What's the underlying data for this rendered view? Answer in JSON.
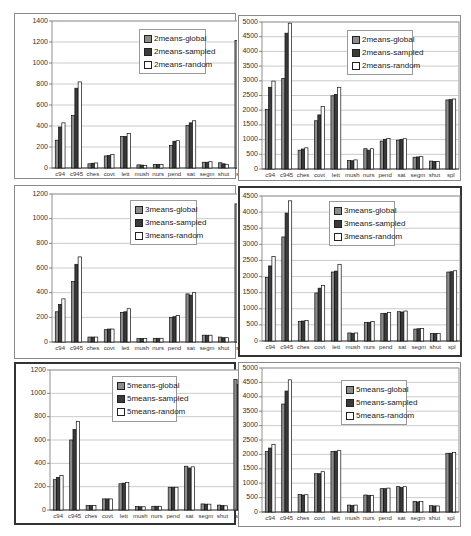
{
  "colors": {
    "global": "#8c8c8c",
    "sampled": "#3a3a3a",
    "random": "#ffffff",
    "bar_stroke": "#111111",
    "grid": "#b5b5b5"
  },
  "chart_data": [
    {
      "type": "bar",
      "title": "",
      "xlabel": "",
      "ylabel": "",
      "ylim": [
        0,
        1400
      ],
      "yticks": [
        0,
        200,
        400,
        600,
        800,
        1000,
        1200,
        1400
      ],
      "grid": true,
      "legend_position": "upper-center-right",
      "categories": [
        "c94",
        "c945",
        "ches",
        "covt",
        "lett",
        "mush",
        "nurs",
        "pend",
        "sat",
        "segm",
        "shut",
        "spl"
      ],
      "series": [
        {
          "name": "2means-global",
          "values": [
            265,
            500,
            40,
            115,
            300,
            30,
            35,
            215,
            405,
            55,
            50,
            1215
          ]
        },
        {
          "name": "2means-sampled",
          "values": [
            390,
            760,
            45,
            120,
            300,
            28,
            35,
            255,
            430,
            55,
            40,
            1225
          ]
        },
        {
          "name": "2means-random",
          "values": [
            430,
            820,
            48,
            130,
            330,
            25,
            35,
            260,
            450,
            60,
            35,
            1260
          ]
        }
      ]
    },
    {
      "type": "bar",
      "title": "",
      "xlabel": "",
      "ylabel": "",
      "ylim": [
        0,
        5000
      ],
      "yticks": [
        0,
        500,
        1000,
        1500,
        2000,
        2500,
        3000,
        3500,
        4000,
        4500,
        5000
      ],
      "grid": true,
      "legend_position": "upper-right",
      "categories": [
        "c94",
        "c945",
        "ches",
        "covt",
        "lett",
        "mush",
        "nurs",
        "pend",
        "sat",
        "segm",
        "shut",
        "spl"
      ],
      "series": [
        {
          "name": "2means-global",
          "values": [
            2030,
            3080,
            640,
            1640,
            2490,
            290,
            690,
            950,
            980,
            400,
            270,
            2350
          ]
        },
        {
          "name": "2means-sampled",
          "values": [
            2780,
            4620,
            680,
            1840,
            2540,
            280,
            640,
            1010,
            1010,
            410,
            260,
            2360
          ]
        },
        {
          "name": "2means-random",
          "values": [
            2990,
            4960,
            720,
            2130,
            2780,
            310,
            690,
            1040,
            1030,
            420,
            260,
            2380
          ]
        }
      ]
    },
    {
      "type": "bar",
      "title": "",
      "xlabel": "",
      "ylabel": "",
      "ylim": [
        0,
        1200
      ],
      "yticks": [
        0,
        200,
        400,
        600,
        800,
        1000,
        1200
      ],
      "grid": true,
      "legend_position": "upper-center-right",
      "categories": [
        "c94",
        "c945",
        "ches",
        "covt",
        "lett",
        "mush",
        "nurs",
        "pend",
        "sat",
        "segm",
        "shut",
        "spl"
      ],
      "series": [
        {
          "name": "3means-global",
          "values": [
            245,
            490,
            40,
            100,
            240,
            28,
            30,
            200,
            390,
            55,
            40,
            1120
          ]
        },
        {
          "name": "3means-sampled",
          "values": [
            305,
            630,
            40,
            105,
            245,
            28,
            30,
            205,
            380,
            55,
            35,
            1115
          ]
        },
        {
          "name": "3means-random",
          "values": [
            350,
            690,
            40,
            105,
            270,
            28,
            30,
            215,
            400,
            55,
            35,
            1165
          ]
        }
      ]
    },
    {
      "type": "bar",
      "title": "",
      "xlabel": "",
      "ylabel": "",
      "ylim": [
        0,
        4500
      ],
      "yticks": [
        0,
        500,
        1000,
        1500,
        2000,
        2500,
        3000,
        3500,
        4000,
        4500
      ],
      "grid": true,
      "legend_position": "upper-center",
      "categories": [
        "c94",
        "c945",
        "ches",
        "covt",
        "lett",
        "mush",
        "nurs",
        "pend",
        "sat",
        "segm",
        "shut",
        "spl"
      ],
      "series": [
        {
          "name": "3means-global",
          "values": [
            1970,
            3230,
            610,
            1490,
            2140,
            250,
            570,
            850,
            910,
            370,
            230,
            2140
          ]
        },
        {
          "name": "3means-sampled",
          "values": [
            2330,
            3970,
            620,
            1640,
            2170,
            240,
            580,
            860,
            900,
            380,
            230,
            2150
          ]
        },
        {
          "name": "3means-random",
          "values": [
            2620,
            4350,
            640,
            1720,
            2380,
            250,
            610,
            890,
            930,
            390,
            230,
            2180
          ]
        }
      ]
    },
    {
      "type": "bar",
      "title": "",
      "xlabel": "",
      "ylabel": "",
      "ylim": [
        0,
        1200
      ],
      "yticks": [
        0,
        200,
        400,
        600,
        800,
        1000,
        1200
      ],
      "grid": true,
      "legend_position": "upper-center-right",
      "categories": [
        "c94",
        "c945",
        "ches",
        "covt",
        "lett",
        "mush",
        "nurs",
        "pend",
        "sat",
        "segm",
        "shut",
        "spl"
      ],
      "series": [
        {
          "name": "5means-global",
          "values": [
            260,
            600,
            38,
            95,
            225,
            30,
            32,
            195,
            375,
            52,
            42,
            1120
          ]
        },
        {
          "name": "5means-sampled",
          "values": [
            280,
            690,
            38,
            95,
            230,
            28,
            32,
            195,
            360,
            50,
            38,
            1075
          ]
        },
        {
          "name": "5means-random",
          "values": [
            295,
            760,
            38,
            95,
            235,
            28,
            32,
            195,
            370,
            50,
            36,
            1120
          ]
        }
      ]
    },
    {
      "type": "bar",
      "title": "",
      "xlabel": "",
      "ylabel": "",
      "ylim": [
        0,
        5000
      ],
      "yticks": [
        0,
        500,
        1000,
        1500,
        2000,
        2500,
        3000,
        3500,
        4000,
        4500,
        5000
      ],
      "grid": true,
      "legend_position": "upper-center-right",
      "categories": [
        "c94",
        "c945",
        "ches",
        "covt",
        "lett",
        "mush",
        "nurs",
        "pend",
        "sat",
        "segm",
        "shut",
        "spl"
      ],
      "series": [
        {
          "name": "5means-global",
          "values": [
            2100,
            3750,
            610,
            1330,
            2100,
            240,
            590,
            810,
            880,
            370,
            220,
            2040
          ]
        },
        {
          "name": "5means-sampled",
          "values": [
            2220,
            4200,
            590,
            1330,
            2110,
            230,
            580,
            810,
            850,
            350,
            210,
            2040
          ]
        },
        {
          "name": "5means-random",
          "values": [
            2350,
            4590,
            600,
            1400,
            2130,
            240,
            570,
            830,
            880,
            360,
            210,
            2070
          ]
        }
      ]
    }
  ],
  "panels": [
    {
      "left": 14,
      "top": 13,
      "width": 222,
      "height": 166,
      "border": "thin",
      "plot": {
        "x": 37,
        "y": 7,
        "w": 196,
        "h": 147
      },
      "legend": {
        "x": 124,
        "y": 15,
        "w": 67,
        "h": 45
      }
    },
    {
      "left": 238,
      "top": 15,
      "width": 223,
      "height": 166,
      "border": "thin",
      "plot": {
        "x": 23,
        "y": 6,
        "w": 197,
        "h": 147
      },
      "legend": {
        "x": 108,
        "y": 14,
        "w": 66,
        "h": 45
      }
    },
    {
      "left": 14,
      "top": 185,
      "width": 222,
      "height": 174,
      "border": "thin",
      "plot": {
        "x": 37,
        "y": 8,
        "w": 196,
        "h": 148
      },
      "legend": {
        "x": 115,
        "y": 14,
        "w": 67,
        "h": 45
      }
    },
    {
      "left": 238,
      "top": 186,
      "width": 224,
      "height": 171,
      "border": "thick",
      "plot": {
        "x": 22,
        "y": 8,
        "w": 198,
        "h": 145
      },
      "legend": {
        "x": 89,
        "y": 13,
        "w": 66,
        "h": 45
      }
    },
    {
      "left": 14,
      "top": 362,
      "width": 222,
      "height": 163,
      "border": "thick",
      "plot": {
        "x": 34,
        "y": 6,
        "w": 197,
        "h": 140
      },
      "legend": {
        "x": 96,
        "y": 12,
        "w": 65,
        "h": 46
      }
    },
    {
      "left": 238,
      "top": 362,
      "width": 223,
      "height": 165,
      "border": "thin",
      "plot": {
        "x": 23,
        "y": 5,
        "w": 197,
        "h": 144
      },
      "legend": {
        "x": 102,
        "y": 17,
        "w": 66,
        "h": 45
      }
    }
  ]
}
